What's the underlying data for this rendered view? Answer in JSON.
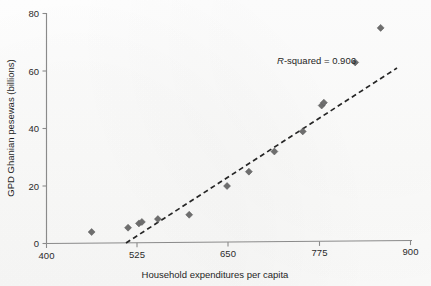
{
  "figure": {
    "background_color": "#fdfdfc",
    "marker_color": "#6e6e6e",
    "axis_color": "#8a8a8a",
    "trendline_color": "#262626"
  },
  "annotation": {
    "r_squared_prefix": "R",
    "r_squared_text": "-squared = 0.906",
    "r_squared_full": "R-squared = 0.906",
    "value": 0.906
  },
  "chart_data": {
    "type": "scatter",
    "title": "",
    "xlabel": "Household expenditures per capita",
    "ylabel": "GPD Ghanian pesewas (billions)",
    "xlim": [
      400,
      900
    ],
    "ylim": [
      0,
      80
    ],
    "xticks": [
      400,
      525,
      650,
      775,
      900
    ],
    "yticks": [
      0,
      20,
      40,
      60,
      80
    ],
    "xtick_labels": [
      "400",
      "525",
      "650",
      "775",
      "900"
    ],
    "ytick_labels": [
      "0",
      "20",
      "40",
      "60",
      "80"
    ],
    "grid": false,
    "legend": null,
    "marker_shape": "diamond",
    "points": [
      {
        "x": 462,
        "y": 4
      },
      {
        "x": 512,
        "y": 5.5
      },
      {
        "x": 527,
        "y": 7
      },
      {
        "x": 531,
        "y": 7.5
      },
      {
        "x": 553,
        "y": 8.5
      },
      {
        "x": 596,
        "y": 10
      },
      {
        "x": 648,
        "y": 20
      },
      {
        "x": 678,
        "y": 25
      },
      {
        "x": 713,
        "y": 32
      },
      {
        "x": 752,
        "y": 39
      },
      {
        "x": 778,
        "y": 48
      },
      {
        "x": 781,
        "y": 49
      },
      {
        "x": 824,
        "y": 63
      },
      {
        "x": 859,
        "y": 75
      }
    ],
    "trendline": {
      "type": "linear-dashed",
      "x_start": 518,
      "y_start": 0,
      "x_end": 885,
      "y_end": 62,
      "r_squared": 0.906
    }
  }
}
